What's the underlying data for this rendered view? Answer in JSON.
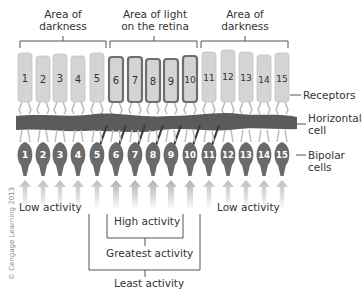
{
  "diagram": {
    "top_labels": {
      "left_dark": [
        "Area of",
        "darkness"
      ],
      "light": [
        "Area of light",
        "on the retina"
      ],
      "right_dark": [
        "Area of",
        "darkness"
      ]
    },
    "side_labels": {
      "receptors": "Receptors",
      "horizontal_cell": [
        "Horizontal",
        "cell"
      ],
      "bipolar_cells": [
        "Bipolar",
        "cells"
      ]
    },
    "receptors": [
      {
        "n": "1",
        "x": 25,
        "lit": false
      },
      {
        "n": "2",
        "x": 43,
        "lit": false
      },
      {
        "n": "3",
        "x": 60,
        "lit": false
      },
      {
        "n": "4",
        "x": 78,
        "lit": false
      },
      {
        "n": "5",
        "x": 97,
        "lit": false
      },
      {
        "n": "6",
        "x": 116,
        "lit": true
      },
      {
        "n": "7",
        "x": 135,
        "lit": true
      },
      {
        "n": "8",
        "x": 153,
        "lit": true
      },
      {
        "n": "9",
        "x": 171,
        "lit": true
      },
      {
        "n": "10",
        "x": 190,
        "lit": true
      },
      {
        "n": "11",
        "x": 209,
        "lit": false
      },
      {
        "n": "12",
        "x": 228,
        "lit": false
      },
      {
        "n": "13",
        "x": 246,
        "lit": false
      },
      {
        "n": "14",
        "x": 264,
        "lit": false
      },
      {
        "n": "15",
        "x": 282,
        "lit": false
      }
    ],
    "bipolars": [
      "1",
      "2",
      "3",
      "4",
      "5",
      "6",
      "7",
      "8",
      "9",
      "10",
      "11",
      "12",
      "13",
      "14",
      "15"
    ],
    "activity_labels": {
      "low_left": "Low activity",
      "low_right": "Low activity",
      "high": "High activity",
      "greatest": "Greatest activity",
      "least": "Least activity"
    },
    "copyright": "© Cengage Learning 2013",
    "colors": {
      "receptor_fill": "#d4d4d4",
      "receptor_stroke_lit": "#6e6e6e",
      "horizontal_cell": "#5a5a5a",
      "bipolar": "#6a6a6a",
      "arrow": "#c8c8c8",
      "text": "#333333"
    }
  }
}
